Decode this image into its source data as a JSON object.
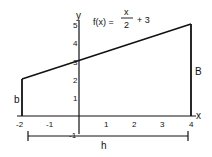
{
  "diagram": {
    "function_label": "f(x) =",
    "fraction_numerator": "x",
    "fraction_denominator": "2",
    "function_suffix": "+ 3",
    "axis_x_label": "x",
    "axis_y_label": "y",
    "left_side_label": "b",
    "right_side_label": "B",
    "height_label": "h",
    "x_ticks": [
      "-2",
      "-1",
      "1",
      "2",
      "3",
      "4"
    ],
    "y_ticks": [
      "1",
      "2",
      "3",
      "4",
      "5"
    ],
    "y_neg_tick": "-1",
    "colors": {
      "stroke": "#111111",
      "background": "#ffffff"
    }
  }
}
